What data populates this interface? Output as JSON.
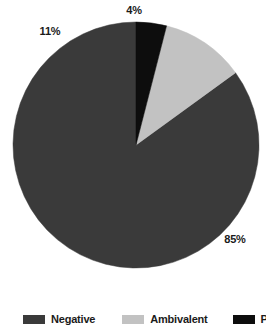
{
  "chart_data": {
    "type": "pie",
    "title": "",
    "subtitle": "",
    "xlabel": "",
    "ylabel": "",
    "grid": false,
    "legend_position": "bottom",
    "start_angle_deg": 90,
    "direction": "counterclockwise",
    "categories": [
      "Negative",
      "Ambivalent",
      "Positive"
    ],
    "values": [
      85,
      11,
      4
    ],
    "labels": [
      "85%",
      "11%",
      "4%"
    ],
    "colors": [
      "#3a3a3a",
      "#c2c2c2",
      "#0d0d0d"
    ],
    "slices": [
      {
        "name": "Negative",
        "value": 85,
        "label": "85%",
        "color": "#3a3a3a"
      },
      {
        "name": "Ambivalent",
        "value": 11,
        "label": "11%",
        "color": "#c2c2c2"
      },
      {
        "name": "Positive",
        "value": 4,
        "label": "4%",
        "color": "#0d0d0d"
      }
    ]
  },
  "data_labels": {
    "positive": "4%",
    "ambivalent": "11%",
    "negative": "85%"
  },
  "legend": {
    "items": [
      {
        "label": "Negative",
        "color": "#3a3a3a"
      },
      {
        "label": "Ambivalent",
        "color": "#c2c2c2"
      },
      {
        "label": "Positive",
        "color": "#0d0d0d"
      }
    ]
  },
  "colors": {
    "negative": "#3a3a3a",
    "ambivalent": "#c2c2c2",
    "positive": "#0d0d0d",
    "text": "#1a1a1a",
    "background": "#ffffff"
  }
}
